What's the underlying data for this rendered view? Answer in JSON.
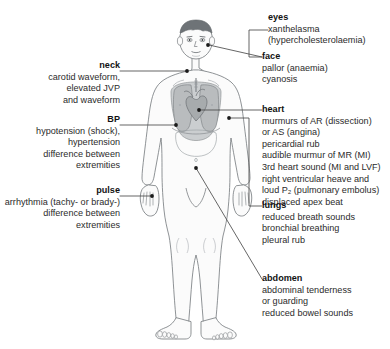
{
  "figure": {
    "alt_name": "anterior-view-human-body-clinical-signs-diagram",
    "colors": {
      "background": "#ffffff",
      "outline": "#7b7f83",
      "skin_fill": "#fbfbfb",
      "hair": "#6e7377",
      "organ_shade": "#b9bcbe",
      "lung_fill": "#c6c9cb",
      "leader_line": "#4a4a4a",
      "marker_dot": "#1a1a1a",
      "text": "#2b2b2b",
      "heading_text": "#121212"
    }
  },
  "labels_left": [
    {
      "id": "neck",
      "heading": "neck",
      "lines": [
        "carotid waveform,",
        "elevated JVP",
        "and waveform"
      ]
    },
    {
      "id": "bp",
      "heading": "BP",
      "lines": [
        "hypotension (shock),",
        "hypertension",
        "difference between",
        "extremities"
      ]
    },
    {
      "id": "pulse",
      "heading": "pulse",
      "lines": [
        "arrhythmia (tachy- or brady-)",
        "difference between",
        "extremities"
      ]
    }
  ],
  "labels_right": [
    {
      "id": "eyes",
      "heading": "eyes",
      "lines": [
        "xanthelasma",
        "(hypercholesterolaemia)"
      ]
    },
    {
      "id": "face",
      "heading": "face",
      "lines": [
        "pallor (anaemia)",
        "cyanosis"
      ]
    },
    {
      "id": "heart",
      "heading": "heart",
      "lines": [
        "murmurs of AR (dissection)",
        "or AS (angina)",
        "pericardial rub",
        "audible murmur of MR (MI)",
        "3rd heart sound (MI and LVF)",
        "right ventricular heave and",
        "loud P₂ (pulmonary embolus)",
        "displaced apex beat"
      ]
    },
    {
      "id": "lungs",
      "heading": "lungs",
      "lines": [
        "reduced breath sounds",
        "bronchial breathing",
        "pleural rub"
      ]
    },
    {
      "id": "abdomen",
      "heading": "abdomen",
      "lines": [
        "abdominal tenderness",
        "or guarding",
        "reduced bowel sounds"
      ]
    }
  ],
  "caption": {
    "text": ""
  }
}
